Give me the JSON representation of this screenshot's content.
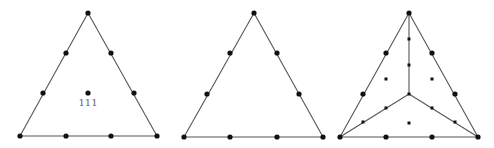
{
  "colors": {
    "edge": "#555555",
    "node": "#111111",
    "label": "#666666",
    "background": "#ffffff"
  },
  "diagrams": [
    {
      "name": "triangle-with-center",
      "vertices": [
        [
          88,
          13
        ],
        [
          20,
          136
        ],
        [
          157,
          136
        ]
      ],
      "edges": [
        [
          [
            88,
            13
          ],
          [
            20,
            136
          ]
        ],
        [
          [
            20,
            136
          ],
          [
            157,
            136
          ]
        ],
        [
          [
            157,
            136
          ],
          [
            88,
            13
          ]
        ]
      ],
      "nodes": [
        [
          88,
          13
        ],
        [
          66,
          53
        ],
        [
          43,
          93
        ],
        [
          20,
          136
        ],
        [
          66,
          136
        ],
        [
          111,
          136
        ],
        [
          157,
          136
        ],
        [
          134,
          93
        ],
        [
          111,
          53
        ],
        [
          88,
          93
        ]
      ],
      "small_nodes": [],
      "label": {
        "text": "111",
        "x": 88,
        "y": 106
      }
    },
    {
      "name": "triangle-plain",
      "vertices": [
        [
          254,
          13
        ],
        [
          184,
          137
        ],
        [
          323,
          137
        ]
      ],
      "edges": [
        [
          [
            254,
            13
          ],
          [
            184,
            137
          ]
        ],
        [
          [
            184,
            137
          ],
          [
            323,
            137
          ]
        ],
        [
          [
            323,
            137
          ],
          [
            254,
            13
          ]
        ]
      ],
      "nodes": [
        [
          254,
          13
        ],
        [
          230,
          53
        ],
        [
          207,
          94
        ],
        [
          184,
          137
        ],
        [
          230,
          137
        ],
        [
          277,
          137
        ],
        [
          323,
          137
        ],
        [
          299,
          94
        ],
        [
          277,
          53
        ]
      ],
      "small_nodes": []
    },
    {
      "name": "triangle-subdivided",
      "vertices": [
        [
          409,
          13
        ],
        [
          340,
          137
        ],
        [
          478,
          137
        ]
      ],
      "edges": [
        [
          [
            409,
            13
          ],
          [
            340,
            137
          ]
        ],
        [
          [
            340,
            137
          ],
          [
            478,
            137
          ]
        ],
        [
          [
            478,
            137
          ],
          [
            409,
            13
          ]
        ],
        [
          [
            409,
            13
          ],
          [
            409,
            94
          ]
        ],
        [
          [
            340,
            137
          ],
          [
            409,
            94
          ]
        ],
        [
          [
            478,
            137
          ],
          [
            409,
            94
          ]
        ]
      ],
      "nodes": [
        [
          409,
          13
        ],
        [
          386,
          53
        ],
        [
          363,
          94
        ],
        [
          340,
          137
        ],
        [
          386,
          137
        ],
        [
          432,
          137
        ],
        [
          478,
          137
        ],
        [
          455,
          94
        ],
        [
          432,
          53
        ]
      ],
      "small_nodes": [
        [
          409,
          94
        ],
        [
          409,
          39
        ],
        [
          409,
          65
        ],
        [
          386,
          108
        ],
        [
          363,
          122
        ],
        [
          432,
          108
        ],
        [
          455,
          122
        ],
        [
          386,
          79
        ],
        [
          432,
          79
        ],
        [
          409,
          123
        ]
      ]
    }
  ]
}
